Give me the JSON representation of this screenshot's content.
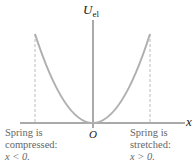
{
  "diagram": {
    "y_axis_label": "U",
    "y_axis_subscript": "el",
    "x_axis_label": "x",
    "origin_label": "O",
    "curve_color": "#b3b3b3",
    "axis_color": "#555555",
    "left_annotation": {
      "line1": "Spring is",
      "line2": "compressed:",
      "line3": "x < 0."
    },
    "right_annotation": {
      "line1": "Spring is",
      "line2": "stretched:",
      "line3": "x > 0."
    }
  }
}
